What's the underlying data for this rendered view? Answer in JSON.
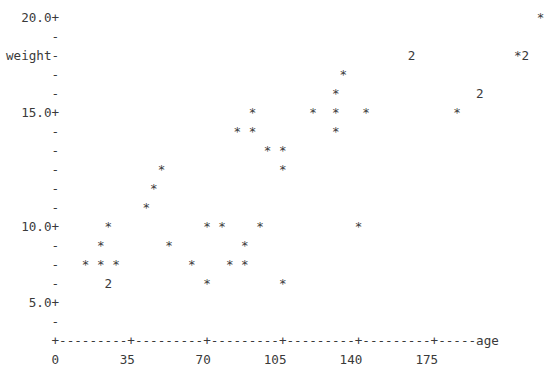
{
  "chart_data": {
    "type": "scatter",
    "title": "",
    "xlabel": "age",
    "ylabel": "weight",
    "style": "ascii-character-plot",
    "grid": false,
    "legend": null,
    "xlim": [
      0,
      192.5
    ],
    "ylim": [
      3.25,
      20.0
    ],
    "y_axis": {
      "label": "weight",
      "label_row": 2,
      "tick_labels": [
        "20.0+",
        "15.0+",
        "10.0+",
        "5.0+"
      ],
      "tick_values": [
        20.0,
        15.0,
        10.0,
        5.0
      ],
      "minor_tick_glyph": "-",
      "rows_per_major": 5,
      "row_step": 1.25
    },
    "x_axis": {
      "label": "age",
      "tick_labels": [
        "0",
        "35",
        "70",
        "105",
        "140",
        "175"
      ],
      "tick_values": [
        0,
        35,
        70,
        105,
        140,
        175
      ],
      "tick_glyph": "+",
      "line_glyph": "-",
      "chars_per_tick": 10,
      "units_per_char": 3.5
    },
    "point_glyph": "*",
    "overplot_glyphs": [
      "2"
    ],
    "points": [
      {
        "age": 14,
        "weight": 13.75,
        "glyph": "*",
        "count": 1
      },
      {
        "age": 14,
        "weight": 12.5,
        "glyph": "*",
        "count": 1
      },
      {
        "age": 14,
        "weight": 11.25,
        "glyph": "*",
        "count": 1
      },
      {
        "age": 7,
        "weight": 10.0,
        "glyph": "*",
        "count": 1
      },
      {
        "age": 10.5,
        "weight": 8.75,
        "glyph": "*",
        "count": 1
      },
      {
        "age": 3.5,
        "weight": 7.5,
        "glyph": "*",
        "count": 1
      },
      {
        "age": 7,
        "weight": 7.5,
        "glyph": "*",
        "count": 1
      },
      {
        "age": 10.5,
        "weight": 7.5,
        "glyph": "*",
        "count": 1
      },
      {
        "age": 14,
        "weight": 6.25,
        "glyph": "2",
        "count": 2
      },
      {
        "age": 38.5,
        "weight": 8.75,
        "glyph": "*",
        "count": 1
      },
      {
        "age": 45.5,
        "weight": 6.25,
        "glyph": "*",
        "count": 1
      },
      {
        "age": 52.5,
        "weight": 11.25,
        "glyph": "*",
        "count": 1
      },
      {
        "age": 56,
        "weight": 10.0,
        "glyph": "*",
        "count": 1
      },
      {
        "age": 59.5,
        "weight": 10.0,
        "glyph": "*",
        "count": 1
      },
      {
        "age": 59.5,
        "weight": 5.0,
        "glyph": "*",
        "count": 1
      },
      {
        "age": 66.5,
        "weight": 12.5,
        "glyph": "*",
        "count": 1
      },
      {
        "age": 70,
        "weight": 7.5,
        "glyph": "*",
        "count": 1
      },
      {
        "age": 73.5,
        "weight": 10.0,
        "glyph": "*",
        "count": 1
      },
      {
        "age": 73.5,
        "weight": 8.75,
        "glyph": "*",
        "count": 1
      },
      {
        "age": 66.5,
        "weight": 6.25,
        "glyph": "*",
        "count": 1
      },
      {
        "age": 70,
        "weight": 6.25,
        "glyph": "*",
        "count": 1
      },
      {
        "age": 94.5,
        "weight": 15.0,
        "glyph": "*",
        "count": 1
      },
      {
        "age": 91,
        "weight": 13.75,
        "glyph": "*",
        "count": 1
      },
      {
        "age": 98,
        "weight": 13.75,
        "glyph": "*",
        "count": 1
      },
      {
        "age": 105,
        "weight": 12.5,
        "glyph": "*",
        "count": 1
      },
      {
        "age": 108.5,
        "weight": 12.5,
        "glyph": "*",
        "count": 1
      },
      {
        "age": 98,
        "weight": 11.25,
        "glyph": "*",
        "count": 1
      },
      {
        "age": 94.5,
        "weight": 5.0,
        "glyph": "*",
        "count": 1
      },
      {
        "age": 115.5,
        "weight": 10.0,
        "glyph": "*",
        "count": 1
      },
      {
        "age": 122.5,
        "weight": 15.0,
        "glyph": "*",
        "count": 1
      },
      {
        "age": 133,
        "weight": 17.5,
        "glyph": "*",
        "count": 1
      },
      {
        "age": 136.5,
        "weight": 16.25,
        "glyph": "*",
        "count": 1
      },
      {
        "age": 136.5,
        "weight": 15.0,
        "glyph": "*",
        "count": 1
      },
      {
        "age": 143.5,
        "weight": 15.0,
        "glyph": "*",
        "count": 1
      },
      {
        "age": 140,
        "weight": 13.75,
        "glyph": "*",
        "count": 1
      },
      {
        "age": 154,
        "weight": 18.75,
        "glyph": "2",
        "count": 2
      },
      {
        "age": 161,
        "weight": 16.25,
        "glyph": "2",
        "count": 2
      },
      {
        "age": 168,
        "weight": 15.0,
        "glyph": "*",
        "count": 1
      },
      {
        "age": 185.5,
        "weight": 20.0,
        "glyph": "*",
        "count": 1
      },
      {
        "age": 182,
        "weight": 18.75,
        "glyph": "*",
        "count": 1
      },
      {
        "age": 185.5,
        "weight": 18.75,
        "glyph": "2",
        "count": 2
      }
    ]
  },
  "plot": {
    "rows": [
      "  20.0+                                                               *",
      "      -",
      "weight-                                              2             *2",
      "      -                                     *",
      "      -                                    *                  2",
      "  15.0+                         *       *  *   *           *",
      "      -                       * *          *",
      "      -                           * *",
      "      -             *               *",
      "      -            *",
      "      -           *",
      "  10.0+      *            * *    *            *",
      "      -     *        *         *",
      "      -   * * *         *    * *",
      "      -      2            *         *",
      "   5.0+",
      "      -",
      "      +---------+---------+---------+---------+---------+-----age",
      "      0        35        70       105       140       175"
    ],
    "ascii_art": "  20.0+                                                               *\n      -\nweight-                                              2             *2\n      -                                     *\n      -                                    *                  2\n  15.0+                         *       *  *   *           *\n      -                       * *          *\n      -                           * *\n      -             *               *\n      -            *\n      -           *\n  10.0+      *            * *    *            *\n      -     *        *         *\n      -   * * *         *    * *\n      -      2            *         *\n   5.0+\n      -\n      +---------+---------+---------+---------+---------+-----age\n      0        35        70       105       140       175"
  },
  "colors": {
    "text": "#3a3a3a",
    "background": "#ffffff"
  }
}
